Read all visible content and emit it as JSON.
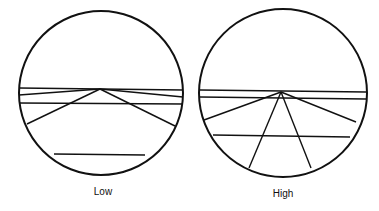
{
  "diagrams": [
    {
      "id": "low",
      "label": "Low",
      "circle": {
        "cx": 101,
        "cy": 93,
        "r": 82
      },
      "apex": {
        "x": 100,
        "y": 89
      },
      "lines": [
        {
          "x1": 19,
          "y1": 88,
          "x2": 183,
          "y2": 90
        },
        {
          "x1": 19,
          "y1": 95,
          "x2": 100,
          "y2": 89
        },
        {
          "x1": 100,
          "y1": 89,
          "x2": 183,
          "y2": 97
        },
        {
          "x1": 19,
          "y1": 103,
          "x2": 183,
          "y2": 104
        },
        {
          "x1": 100,
          "y1": 89,
          "x2": 27,
          "y2": 124
        },
        {
          "x1": 100,
          "y1": 89,
          "x2": 175,
          "y2": 126
        },
        {
          "x1": 54,
          "y1": 154,
          "x2": 145,
          "y2": 155
        }
      ]
    },
    {
      "id": "high",
      "label": "High",
      "circle": {
        "cx": 283,
        "cy": 93,
        "r": 84
      },
      "apex": {
        "x": 281,
        "y": 92
      },
      "lines": [
        {
          "x1": 200,
          "y1": 90,
          "x2": 366,
          "y2": 92
        },
        {
          "x1": 200,
          "y1": 97,
          "x2": 366,
          "y2": 99
        },
        {
          "x1": 281,
          "y1": 92,
          "x2": 204,
          "y2": 120
        },
        {
          "x1": 281,
          "y1": 92,
          "x2": 356,
          "y2": 122
        },
        {
          "x1": 281,
          "y1": 92,
          "x2": 249,
          "y2": 168
        },
        {
          "x1": 281,
          "y1": 92,
          "x2": 311,
          "y2": 168
        },
        {
          "x1": 213,
          "y1": 135,
          "x2": 350,
          "y2": 137
        }
      ]
    }
  ],
  "colors": {
    "stroke": "#111111",
    "background": "#ffffff"
  }
}
